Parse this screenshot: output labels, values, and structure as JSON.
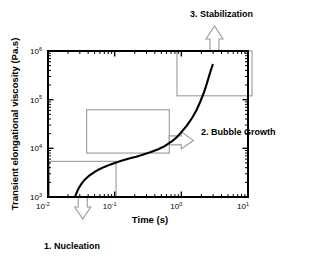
{
  "figure": {
    "name": "foaming-viscosity-stages-figure",
    "background": "#ffffff",
    "curve_color": "#000000",
    "frame_color": "#000000",
    "callout_color": "#9a9a9a"
  },
  "chart_data": {
    "type": "line",
    "title": "",
    "xlabel": "Time (s)",
    "ylabel": "Transient elongational viscosity (Pa.s)",
    "xscale": "log",
    "yscale": "log",
    "xlim": [
      0.01,
      10
    ],
    "ylim": [
      1000,
      1000000
    ],
    "grid": false,
    "legend": "none",
    "xticks": [
      {
        "value": 0.01,
        "mantissa": "10",
        "exponent": "-2"
      },
      {
        "value": 0.1,
        "mantissa": "10",
        "exponent": "-1"
      },
      {
        "value": 1,
        "mantissa": "10",
        "exponent": "0"
      },
      {
        "value": 10,
        "mantissa": "10",
        "exponent": "1"
      }
    ],
    "yticks": [
      {
        "value": 1000,
        "mantissa": "10",
        "exponent": "3"
      },
      {
        "value": 10000,
        "mantissa": "10",
        "exponent": "4"
      },
      {
        "value": 100000,
        "mantissa": "10",
        "exponent": "5"
      },
      {
        "value": 1000000,
        "mantissa": "10",
        "exponent": "6"
      }
    ],
    "series": [
      {
        "name": "transient elongational viscosity",
        "x": [
          0.0255,
          0.0262,
          0.0275,
          0.0295,
          0.0325,
          0.0365,
          0.042,
          0.049,
          0.058,
          0.07,
          0.085,
          0.105,
          0.13,
          0.165,
          0.21,
          0.27,
          0.35,
          0.45,
          0.57,
          0.7,
          0.85,
          1.0,
          1.2,
          1.45,
          1.7,
          1.95,
          2.2,
          2.45,
          2.7,
          2.95
        ],
        "y": [
          1020,
          1120,
          1320,
          1600,
          1950,
          2350,
          2780,
          3220,
          3680,
          4150,
          4620,
          5100,
          5600,
          6150,
          6750,
          7500,
          8400,
          9600,
          11200,
          13500,
          16800,
          21500,
          29000,
          42000,
          62000,
          95000,
          145000,
          230000,
          360000,
          520000
        ]
      }
    ],
    "annotations": [
      {
        "id": "nucleation",
        "label": "1. Nucleation",
        "stage": 1,
        "box_region": {
          "x_from": 0.0105,
          "x_to": 0.105,
          "y_from": 1000,
          "y_to": 5400
        },
        "arrow_direction": "down"
      },
      {
        "id": "bubble-growth",
        "label": "2. Bubble Growth",
        "stage": 2,
        "box_region": {
          "x_from": 0.038,
          "x_to": 0.66,
          "y_from": 8000,
          "y_to": 62000
        },
        "arrow_direction": "left"
      },
      {
        "id": "stabilization",
        "label": "3. Stabilization",
        "stage": 3,
        "box_region": {
          "x_from": 0.86,
          "x_to": 11.5,
          "y_from": 120000,
          "y_to": 1000000
        },
        "arrow_direction": "up"
      }
    ]
  }
}
